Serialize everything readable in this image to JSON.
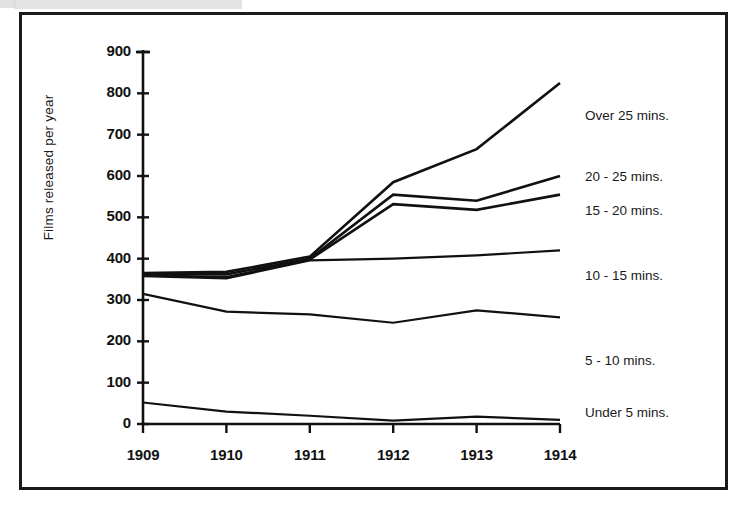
{
  "figure": {
    "background_color": "#ffffff",
    "border_color": "#1a1a1a",
    "line_color": "#111111"
  },
  "chart_data": {
    "type": "line",
    "title": "",
    "xlabel": "",
    "ylabel": "Films released per year",
    "x": [
      "1909",
      "1910",
      "1911",
      "1912",
      "1913",
      "1914"
    ],
    "categories": [
      "1909",
      "1910",
      "1911",
      "1912",
      "1913",
      "1914"
    ],
    "ylim": [
      0,
      900
    ],
    "ytick_values": [
      0,
      100,
      200,
      300,
      400,
      500,
      600,
      700,
      800,
      900
    ],
    "ytick_labels": [
      "0",
      "100",
      "200",
      "300",
      "400",
      "500",
      "600",
      "700",
      "800",
      "900"
    ],
    "xtick_labels": [
      "1909",
      "1910",
      "1911",
      "1912",
      "1913",
      "1914"
    ],
    "grid": false,
    "legend_position": "right-inline",
    "series": [
      {
        "name": "Over 25 mins.",
        "label": "Over 25 mins.",
        "values": [
          365,
          368,
          405,
          585,
          665,
          825
        ]
      },
      {
        "name": "20 - 25 mins.",
        "label": "20 - 25 mins.",
        "values": [
          363,
          362,
          400,
          555,
          540,
          600
        ]
      },
      {
        "name": "15 - 20 mins.",
        "label": "15 - 20 mins.",
        "values": [
          360,
          355,
          398,
          532,
          518,
          555
        ]
      },
      {
        "name": "10 - 15 mins.",
        "label": "10 - 15 mins.",
        "values": [
          358,
          352,
          396,
          400,
          408,
          420
        ]
      },
      {
        "name": "5 - 10 mins.",
        "label": "5 - 10 mins.",
        "values": [
          315,
          272,
          265,
          245,
          275,
          258
        ]
      },
      {
        "name": "Under 5 mins.",
        "label": "Under 5 mins.",
        "values": [
          52,
          30,
          20,
          8,
          18,
          10
        ]
      }
    ],
    "legend_entries": [
      "Over 25 mins.",
      "20 - 25 mins.",
      "15 - 20 mins.",
      "10 - 15 mins.",
      "5 - 10 mins.",
      "Under 5 mins."
    ]
  },
  "legend_positions_px": [
    {
      "label": "Over 25 mins.",
      "x": 585,
      "y": 117
    },
    {
      "label": "20 - 25 mins.",
      "x": 585,
      "y": 178
    },
    {
      "label": "15 - 20 mins.",
      "x": 585,
      "y": 212
    },
    {
      "label": "10 - 15 mins.",
      "x": 585,
      "y": 277
    },
    {
      "label": "5 - 10 mins.",
      "x": 585,
      "y": 362
    },
    {
      "label": "Under 5 mins.",
      "x": 585,
      "y": 414
    }
  ]
}
